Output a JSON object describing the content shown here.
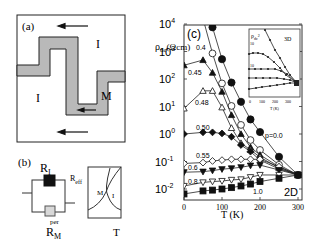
{
  "panel_a": {
    "label": "(a)",
    "region_labels": [
      "I",
      "I",
      "M"
    ],
    "arrows": [
      "top-arrow-left",
      "stripe-arrow-left",
      "bottom-arrow-left"
    ]
  },
  "panel_b": {
    "label": "(b)",
    "r_insulating": "R",
    "r_insulating_sub": "I",
    "r_metal": "R",
    "r_metal_sub": "M",
    "r_metal_sup": "per",
    "r_eff": "R",
    "r_eff_sub": "eff",
    "graph_label_m": "M",
    "graph_label_i": "I",
    "graph_xlabel": "T"
  },
  "chart_data": {
    "type": "line",
    "panel_label": "(c)",
    "title": "",
    "ylabel": "ρdc (Ωcm)",
    "xlabel": "T (K)",
    "yscale": "log",
    "ylim": [
      0.01,
      10000
    ],
    "xlim": [
      0,
      300
    ],
    "xticks": [
      0,
      100,
      200,
      300
    ],
    "yticks": [
      "10^4",
      "10^3",
      "10^2",
      "10^1",
      "10^0",
      "10^-1",
      "10^-2"
    ],
    "annotation": "2D",
    "legend_position": "inline labels",
    "series": [
      {
        "name": "p=0.0",
        "marker": "filled-circle",
        "x": [
          75,
          100,
          125,
          150,
          175,
          200,
          250,
          300
        ],
        "log10_y": [
          3.88,
          2.72,
          1.87,
          1.17,
          0.53,
          0.07,
          -0.83,
          -1.49
        ]
      },
      {
        "name": "0.4",
        "marker": "open-circle",
        "x": [
          75,
          100,
          125,
          150,
          175,
          200,
          250,
          300
        ],
        "log10_y": [
          2.93,
          1.84,
          1.02,
          0.33,
          -0.22,
          -0.58,
          -1.12,
          -1.49
        ]
      },
      {
        "name": "0.45",
        "marker": "filled-triangle-up",
        "x": [
          0,
          50,
          75,
          100,
          125,
          150,
          175,
          200,
          250,
          300
        ],
        "log10_y": [
          2.5,
          2.69,
          2.23,
          1.54,
          0.69,
          0.0,
          -0.48,
          -0.76,
          -1.19,
          -1.49
        ]
      },
      {
        "name": "0.48",
        "marker": "open-triangle-up",
        "x": [
          0,
          50,
          75,
          100,
          125,
          150,
          175,
          200,
          250,
          300
        ],
        "log10_y": [
          0.93,
          1.57,
          1.57,
          0.97,
          0.22,
          -0.33,
          -0.58,
          -0.84,
          -1.24,
          -1.49
        ]
      },
      {
        "name": "0.50",
        "marker": "filled-diamond",
        "x": [
          0,
          50,
          75,
          100,
          125,
          150,
          175,
          200,
          250,
          300
        ],
        "log10_y": [
          0.0,
          0.06,
          0.06,
          0.02,
          -0.1,
          -0.4,
          -0.64,
          -0.95,
          -1.27,
          -1.49
        ]
      },
      {
        "name": "0.55",
        "marker": "open-diamond",
        "x": [
          0,
          50,
          75,
          100,
          125,
          150,
          175,
          200,
          250,
          300
        ],
        "log10_y": [
          -1.07,
          -1.04,
          -0.98,
          -0.95,
          -0.92,
          -0.92,
          -0.92,
          -0.92,
          -1.19,
          -1.49
        ]
      },
      {
        "name": "0.6",
        "marker": "filled-triangle-down",
        "x": [
          0,
          50,
          75,
          100,
          125,
          150,
          175,
          200,
          250,
          300
        ],
        "log10_y": [
          -1.39,
          -1.37,
          -1.33,
          -1.28,
          -1.25,
          -1.21,
          -1.15,
          -1.13,
          -1.31,
          -1.49
        ]
      },
      {
        "name": "0.8",
        "marker": "open-triangle-down",
        "x": [
          0,
          50,
          75,
          100,
          125,
          150,
          175,
          200,
          250,
          300
        ],
        "log10_y": [
          -1.89,
          -1.76,
          -1.73,
          -1.71,
          -1.67,
          -1.65,
          -1.57,
          -1.49,
          -1.49,
          -1.49
        ]
      },
      {
        "name": "1.0",
        "marker": "filled-square",
        "x": [
          0,
          50,
          75,
          100,
          125,
          150,
          175,
          200,
          250,
          300
        ],
        "log10_y": [
          -2.18,
          -2.07,
          -2.04,
          -2.0,
          -1.95,
          -1.89,
          -1.82,
          -1.73,
          -1.61,
          -1.49
        ]
      }
    ],
    "inset": {
      "ylabel": "ρdc",
      "xlabel": "T (K)",
      "annotation": "3D",
      "xticks": [
        0,
        100,
        200,
        300
      ],
      "ytick_labels": [
        "10",
        "10"
      ],
      "series_count": 5
    }
  }
}
